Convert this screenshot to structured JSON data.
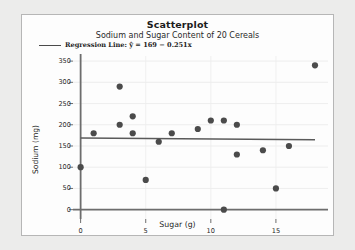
{
  "chart_data": {
    "type": "scatter",
    "title": "Scatterplot",
    "subtitle": "Sodium and Sugar Content of 20 Cereals",
    "xlabel": "Sugar (g)",
    "ylabel": "Sodium (mg)",
    "xlim": [
      -1.2,
      19
    ],
    "ylim": [
      -22,
      362
    ],
    "xticks": [
      0,
      5,
      10,
      15
    ],
    "yticks": [
      0,
      50,
      100,
      150,
      200,
      250,
      300,
      350
    ],
    "grid": true,
    "legend_position": "top-left",
    "legend": [
      {
        "label": "Regression Line: ŷ = 169 − 0.251x",
        "marker": "line",
        "color": "#4a4a4a"
      }
    ],
    "point_color": "#4b4b4b",
    "line_color": "#5a5a5a",
    "regression": {
      "intercept": 169,
      "slope": -0.251,
      "x_start": 0,
      "x_end": 18
    },
    "x": [
      0,
      1,
      3,
      3,
      4,
      4,
      5,
      6,
      7,
      9,
      10,
      11,
      11,
      12,
      12,
      14,
      15,
      16,
      18,
      2
    ],
    "y": [
      100,
      180,
      290,
      200,
      220,
      180,
      70,
      160,
      180,
      190,
      210,
      210,
      0,
      200,
      130,
      140,
      50,
      150,
      340,
      180
    ],
    "points": [
      {
        "x": 0,
        "y": 100
      },
      {
        "x": 1,
        "y": 180
      },
      {
        "x": 3,
        "y": 290
      },
      {
        "x": 3,
        "y": 200
      },
      {
        "x": 4,
        "y": 220
      },
      {
        "x": 4,
        "y": 180
      },
      {
        "x": 5,
        "y": 70
      },
      {
        "x": 6,
        "y": 160
      },
      {
        "x": 7,
        "y": 180
      },
      {
        "x": 9,
        "y": 190
      },
      {
        "x": 10,
        "y": 210
      },
      {
        "x": 11,
        "y": 210
      },
      {
        "x": 11,
        "y": 0
      },
      {
        "x": 12,
        "y": 200
      },
      {
        "x": 12,
        "y": 130
      },
      {
        "x": 14,
        "y": 140
      },
      {
        "x": 15,
        "y": 50
      },
      {
        "x": 16,
        "y": 150
      },
      {
        "x": 18,
        "y": 340
      }
    ]
  }
}
